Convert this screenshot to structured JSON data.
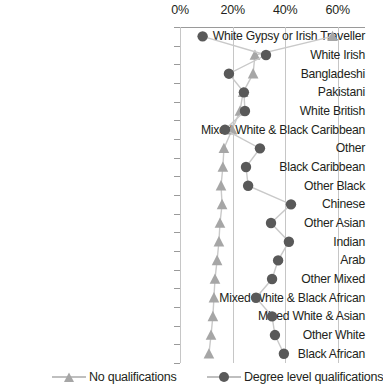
{
  "chart_data": {
    "type": "scatter",
    "title": "",
    "xlabel": "",
    "ylabel": "",
    "orientation": "horizontal",
    "grid": true,
    "legend_position": "bottom",
    "xlim": [
      0,
      65
    ],
    "xticks": [
      0,
      20,
      40,
      60
    ],
    "xtick_labels": [
      "0%",
      "20%",
      "40%",
      "60%"
    ],
    "categories": [
      "White Gypsy or Irish Traveller",
      "White Irish",
      "Bangladeshi",
      "Pakistani",
      "White British",
      "Mixed White & Black Caribbean",
      "Other",
      "Black Caribbean",
      "Other Black",
      "Chinese",
      "Other Asian",
      "Indian",
      "Arab",
      "Other Mixed",
      "Mixed White & Black African",
      "Mixed White & Asian",
      "Other White",
      "Black African"
    ],
    "series": [
      {
        "name": "No qualifications",
        "marker": "triangle",
        "color": "#a6a6a6",
        "values": [
          58.0,
          28.5,
          27.8,
          24.0,
          22.8,
          19.8,
          16.7,
          16.3,
          15.6,
          16.0,
          15.2,
          14.8,
          14.1,
          13.3,
          12.9,
          12.5,
          11.8,
          11.0
        ]
      },
      {
        "name": "Degree level qualifications",
        "marker": "circle",
        "color": "#595959",
        "values": [
          8.6,
          32.7,
          18.6,
          24.3,
          24.7,
          17.1,
          30.4,
          25.1,
          25.9,
          42.2,
          34.6,
          41.4,
          37.3,
          35.0,
          28.9,
          35.0,
          36.1,
          39.5
        ]
      }
    ]
  },
  "legend": {
    "items": [
      {
        "label": "No qualifications"
      },
      {
        "label": "Degree level qualifications"
      }
    ]
  },
  "colors": {
    "no_qualifications": "#a6a6a6",
    "degree_level": "#595959",
    "gridline": "#c6c6c6",
    "axis": "#9a9a9a",
    "text": "#231f20"
  }
}
